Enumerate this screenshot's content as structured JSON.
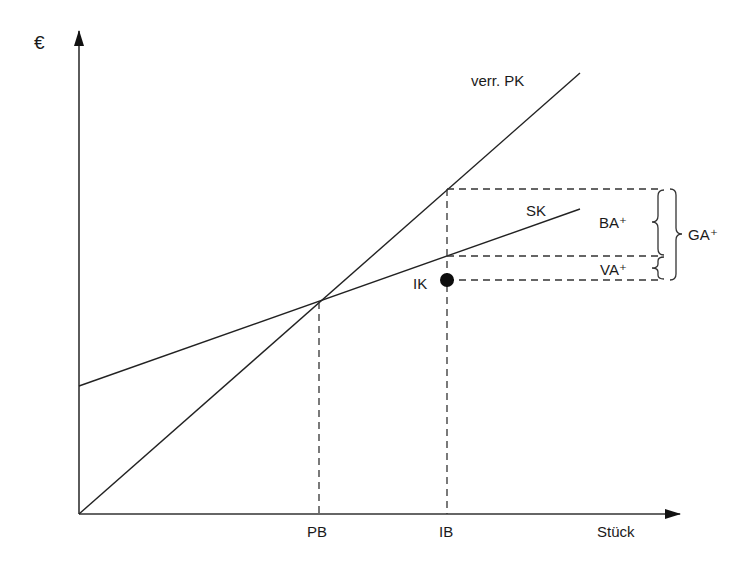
{
  "diagram": {
    "type": "cost-comparison",
    "y_axis_label": "€",
    "x_axis_label": "Stück",
    "lines": [
      {
        "name": "verr. PK",
        "label": "verr. PK"
      },
      {
        "name": "SK",
        "label": "SK"
      }
    ],
    "points": [
      {
        "name": "IK",
        "label": "IK"
      }
    ],
    "x_ticks": [
      {
        "label": "PB"
      },
      {
        "label": "IB"
      }
    ],
    "braces": [
      {
        "label": "BA⁺"
      },
      {
        "label": "VA⁺"
      },
      {
        "label": "GA⁺"
      }
    ],
    "colors": {
      "stroke": "#222222",
      "text": "#1a1a1a",
      "background": "#ffffff"
    }
  }
}
